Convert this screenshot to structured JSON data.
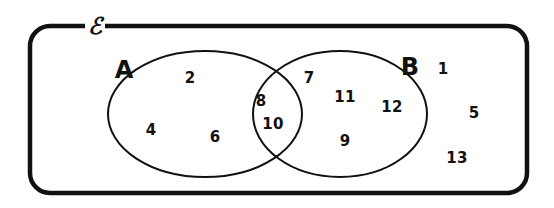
{
  "diagram": {
    "type": "venn-two-set",
    "universal_set_symbol": "ℰ",
    "set_labels": {
      "left": "A",
      "right": "B"
    },
    "regions": {
      "a_only": {
        "name": "A only",
        "values": [
          2,
          4,
          6
        ],
        "items": [
          {
            "text": "2",
            "x": 190,
            "y": 78
          },
          {
            "text": "4",
            "x": 151,
            "y": 130
          },
          {
            "text": "6",
            "x": 215,
            "y": 137
          }
        ]
      },
      "intersection": {
        "name": "A and B",
        "values": [
          8,
          10
        ],
        "items": [
          {
            "text": "8",
            "x": 261,
            "y": 101
          },
          {
            "text": "10",
            "x": 273,
            "y": 124
          }
        ]
      },
      "b_only": {
        "name": "B only",
        "values": [
          7,
          11,
          12,
          9
        ],
        "items": [
          {
            "text": "7",
            "x": 309,
            "y": 78
          },
          {
            "text": "11",
            "x": 345,
            "y": 97
          },
          {
            "text": "12",
            "x": 392,
            "y": 107
          },
          {
            "text": "9",
            "x": 345,
            "y": 141
          }
        ]
      },
      "outside": {
        "name": "Outside A and B",
        "values": [
          1,
          5,
          13
        ],
        "items": [
          {
            "text": "1",
            "x": 443,
            "y": 69
          },
          {
            "text": "5",
            "x": 474,
            "y": 113
          },
          {
            "text": "13",
            "x": 457,
            "y": 158
          }
        ]
      }
    },
    "set_label_positions": {
      "left": {
        "x": 124,
        "y": 70
      },
      "right": {
        "x": 410,
        "y": 67
      }
    },
    "universe_symbol_position": {
      "x": 95,
      "y": 25
    },
    "colors": {
      "stroke": "#111111",
      "background": "#ffffff",
      "text": "#111111"
    },
    "geometry": {
      "rect": {
        "x": 30,
        "y": 26,
        "width": 497,
        "height": 167,
        "radius": 20,
        "stroke_width": 4.5
      },
      "ellipse_a": {
        "cx": 205,
        "cy": 114,
        "rx": 97,
        "ry": 63,
        "stroke_width": 2
      },
      "ellipse_b": {
        "cx": 340,
        "cy": 114,
        "rx": 87,
        "ry": 63,
        "stroke_width": 2
      }
    }
  }
}
